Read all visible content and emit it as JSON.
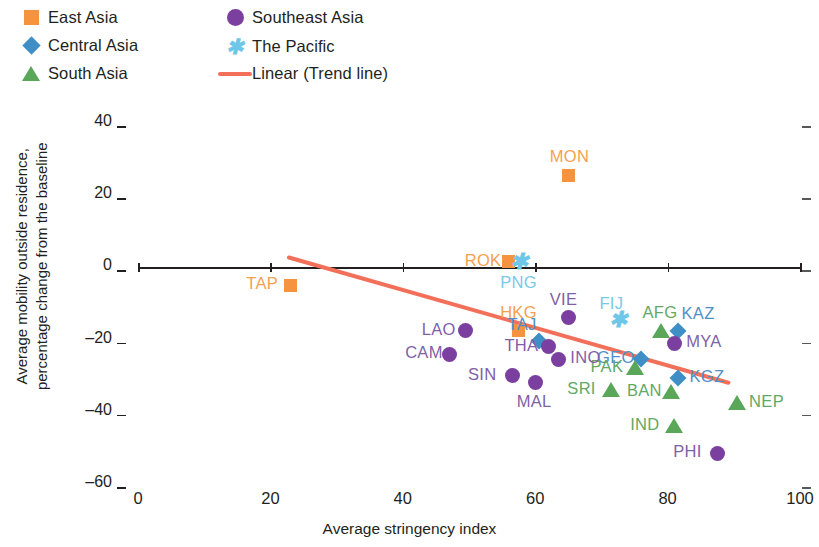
{
  "legend": {
    "items": [
      {
        "label": "East Asia",
        "marker": "square",
        "color": "#f5933f"
      },
      {
        "label": "Central Asia",
        "marker": "diamond",
        "color": "#3f8fc6"
      },
      {
        "label": "South Asia",
        "marker": "triangle",
        "color": "#5aa75a"
      },
      {
        "label": "Southeast Asia",
        "marker": "circle",
        "color": "#7b3fa0"
      },
      {
        "label": "The Pacific",
        "marker": "x",
        "color": "#6ec6e8"
      },
      {
        "label": "Linear (Trend line)",
        "marker": "line",
        "color": "#f2705a"
      }
    ]
  },
  "chart_data": {
    "type": "scatter",
    "title": "",
    "xlabel": "Average stringency index",
    "ylabel": "Average mobility outside residence, percentage change from the baseline",
    "xlim": [
      0,
      100
    ],
    "ylim": [
      -60,
      40
    ],
    "xticks": [
      "0",
      "20",
      "40",
      "60",
      "80",
      "100"
    ],
    "yticks": [
      "40",
      "20",
      "0",
      "-20",
      "-40",
      "-60"
    ],
    "grid": false,
    "legend_position": "top",
    "zero_reference_line": true,
    "series": [
      {
        "name": "East Asia",
        "marker": "square",
        "color": "#f5933f",
        "points": [
          {
            "label": "TAP",
            "x": 23.0,
            "y": -5.0,
            "label_side": "left"
          },
          {
            "label": "ROK",
            "x": 56.0,
            "y": 1.5,
            "label_side": "left"
          },
          {
            "label": "MON",
            "x": 65.0,
            "y": 25.5,
            "label_side": "above"
          },
          {
            "label": "HKG",
            "x": 57.5,
            "y": -17.5,
            "label_side": "above"
          }
        ]
      },
      {
        "name": "Central Asia",
        "marker": "diamond",
        "color": "#3f8fc6",
        "points": [
          {
            "label": "TAJ",
            "x": 60.5,
            "y": -20.5,
            "label_side": "above-left"
          },
          {
            "label": "KAZ",
            "x": 81.5,
            "y": -17.5,
            "label_side": "above-right"
          },
          {
            "label": "GEO",
            "x": 76.0,
            "y": -25.5,
            "label_side": "left"
          },
          {
            "label": "KGZ",
            "x": 81.5,
            "y": -30.5,
            "label_side": "right"
          }
        ]
      },
      {
        "name": "South Asia",
        "marker": "triangle",
        "color": "#5aa75a",
        "points": [
          {
            "label": "AFG",
            "x": 79.0,
            "y": -17.5,
            "label_side": "above"
          },
          {
            "label": "PAK",
            "x": 75.0,
            "y": -28.0,
            "label_side": "left"
          },
          {
            "label": "SRI",
            "x": 71.5,
            "y": -34.0,
            "label_side": "left"
          },
          {
            "label": "BAN",
            "x": 80.5,
            "y": -34.5,
            "label_side": "left"
          },
          {
            "label": "NEP",
            "x": 90.5,
            "y": -37.5,
            "label_side": "right"
          },
          {
            "label": "IND",
            "x": 81.0,
            "y": -44.0,
            "label_side": "left"
          }
        ]
      },
      {
        "name": "Southeast Asia",
        "marker": "circle",
        "color": "#7b3fa0",
        "points": [
          {
            "label": "LAO",
            "x": 49.5,
            "y": -17.5,
            "label_side": "left"
          },
          {
            "label": "CAM",
            "x": 47.0,
            "y": -24.0,
            "label_side": "left"
          },
          {
            "label": "VIE",
            "x": 65.0,
            "y": -14.0,
            "label_side": "above"
          },
          {
            "label": "THA",
            "x": 62.0,
            "y": -22.0,
            "label_side": "left"
          },
          {
            "label": "INO",
            "x": 63.5,
            "y": -25.5,
            "label_side": "right"
          },
          {
            "label": "SIN",
            "x": 56.5,
            "y": -30.0,
            "label_side": "left"
          },
          {
            "label": "MAL",
            "x": 60.0,
            "y": -32.0,
            "label_side": "below"
          },
          {
            "label": "MYA",
            "x": 81.0,
            "y": -21.0,
            "label_side": "right"
          },
          {
            "label": "PHI",
            "x": 87.5,
            "y": -51.5,
            "label_side": "left"
          }
        ]
      },
      {
        "name": "The Pacific",
        "marker": "x",
        "color": "#6ec6e8",
        "points": [
          {
            "label": "PNG",
            "x": 57.5,
            "y": 1.0,
            "label_side": "below"
          },
          {
            "label": "FIJ",
            "x": 72.5,
            "y": -15.0,
            "label_side": "above"
          }
        ]
      }
    ],
    "trend_line": {
      "name": "Linear (Trend line)",
      "color": "#f2705a",
      "x_start": 22.5,
      "y_start": 3.5,
      "x_end": 89.5,
      "y_end": -31.5
    }
  }
}
